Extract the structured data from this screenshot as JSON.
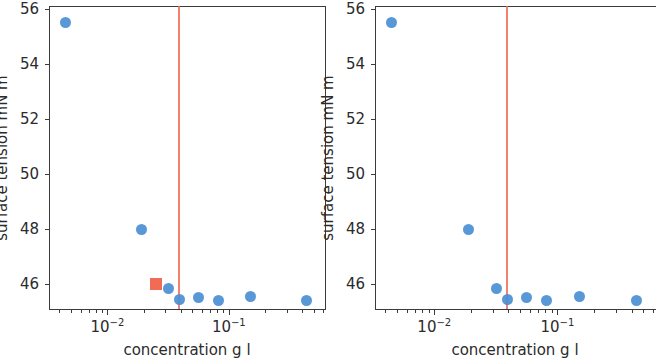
{
  "chart_data": {
    "type": "scatter",
    "title": "",
    "subtitle": "",
    "panels": [
      {
        "name": "left-panel",
        "xlabel": "concentration g l",
        "ylabel": "surface tension mN m",
        "xscale": "log",
        "yscale": "linear",
        "xlim": [
          0.0033,
          0.62
        ],
        "ylim": [
          45.1,
          56.1
        ],
        "yticks": [
          46,
          48,
          50,
          52,
          54,
          56
        ],
        "yticklabels": [
          "46",
          "48",
          "50",
          "52",
          "54",
          "56"
        ],
        "xticks": [
          0.01,
          0.1
        ],
        "xticklabels": [
          "10⁻²",
          "10⁻¹"
        ],
        "grid": false,
        "legend": "none",
        "series": [
          {
            "name": "surface tension measurements",
            "marker": "circle",
            "color": "#4a8fd4",
            "x": [
              0.0045,
              0.019,
              0.032,
              0.039,
              0.056,
              0.082,
              0.15,
              0.44
            ],
            "y": [
              55.5,
              48.0,
              45.85,
              45.45,
              45.5,
              45.4,
              45.55,
              45.4
            ]
          },
          {
            "name": "cmc marker",
            "marker": "square",
            "color": "#ef6048",
            "x": [
              0.025
            ],
            "y": [
              46.0
            ]
          }
        ],
        "vlines": [
          {
            "name": "cmc-line",
            "x": 0.039,
            "color": "#f2705c"
          }
        ]
      },
      {
        "name": "right-panel",
        "xlabel": "concentration g l",
        "ylabel": "surface tension mN m",
        "xscale": "log",
        "yscale": "linear",
        "xlim": [
          0.0033,
          0.62
        ],
        "ylim": [
          45.1,
          56.1
        ],
        "yticks": [
          46,
          48,
          50,
          52,
          54,
          56
        ],
        "yticklabels": [
          "46",
          "48",
          "50",
          "52",
          "54",
          "56"
        ],
        "xticks": [
          0.01,
          0.1
        ],
        "xticklabels": [
          "10⁻²",
          "10⁻¹"
        ],
        "grid": false,
        "legend": "none",
        "series": [
          {
            "name": "surface tension measurements",
            "marker": "circle",
            "color": "#4a8fd4",
            "x": [
              0.0045,
              0.019,
              0.032,
              0.039,
              0.056,
              0.082,
              0.15,
              0.44
            ],
            "y": [
              55.5,
              48.0,
              45.85,
              45.45,
              45.5,
              45.4,
              45.55,
              45.4
            ]
          }
        ],
        "vlines": [
          {
            "name": "cmc-line",
            "x": 0.039,
            "color": "#f2705c"
          }
        ]
      }
    ]
  },
  "colors": {
    "marker_blue": "#4a8fd4",
    "marker_red": "#ef6048",
    "vline_red": "#f2705c",
    "axis": "#3b3b3b",
    "text": "#2b2b2b",
    "background": "#ffffff"
  }
}
